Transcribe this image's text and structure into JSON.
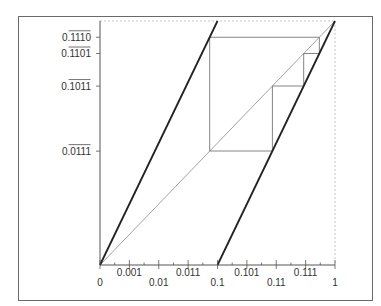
{
  "chart_data": {
    "type": "line",
    "title": "",
    "xlim": [
      0,
      1
    ],
    "ylim": [
      0,
      1
    ],
    "grid": false,
    "x_ticks": [
      {
        "value": 0,
        "label": "0",
        "row": "low"
      },
      {
        "value": 0.125,
        "label": "0.001",
        "row": "high"
      },
      {
        "value": 0.25,
        "label": "0.01",
        "row": "low"
      },
      {
        "value": 0.375,
        "label": "0.011",
        "row": "high"
      },
      {
        "value": 0.5,
        "label": "0.1",
        "row": "low"
      },
      {
        "value": 0.625,
        "label": "0.101",
        "row": "high"
      },
      {
        "value": 0.75,
        "label": "0.11",
        "row": "low"
      },
      {
        "value": 0.875,
        "label": "0.111",
        "row": "high"
      },
      {
        "value": 1,
        "label": "1",
        "row": "low"
      }
    ],
    "y_ticks": [
      {
        "value": 0.4667,
        "prefix": "0.",
        "repeating": "0111"
      },
      {
        "value": 0.7333,
        "prefix": "0.",
        "repeating": "1011"
      },
      {
        "value": 0.8667,
        "prefix": "0.",
        "repeating": "1101"
      },
      {
        "value": 0.9333,
        "prefix": "0.",
        "repeating": "1110"
      }
    ],
    "series": [
      {
        "name": "doubling-map-branch-1",
        "x": [
          0,
          0.5
        ],
        "y": [
          0,
          1
        ]
      },
      {
        "name": "doubling-map-branch-2",
        "x": [
          0.5,
          1
        ],
        "y": [
          0,
          1
        ]
      },
      {
        "name": "diagonal",
        "x": [
          0,
          1
        ],
        "y": [
          0,
          1
        ]
      },
      {
        "name": "period-4-orbit",
        "x": [
          0.4667,
          0.7333,
          0.8667,
          0.9333
        ],
        "y": [
          0.4667,
          0.7333,
          0.8667,
          0.9333
        ]
      }
    ]
  }
}
